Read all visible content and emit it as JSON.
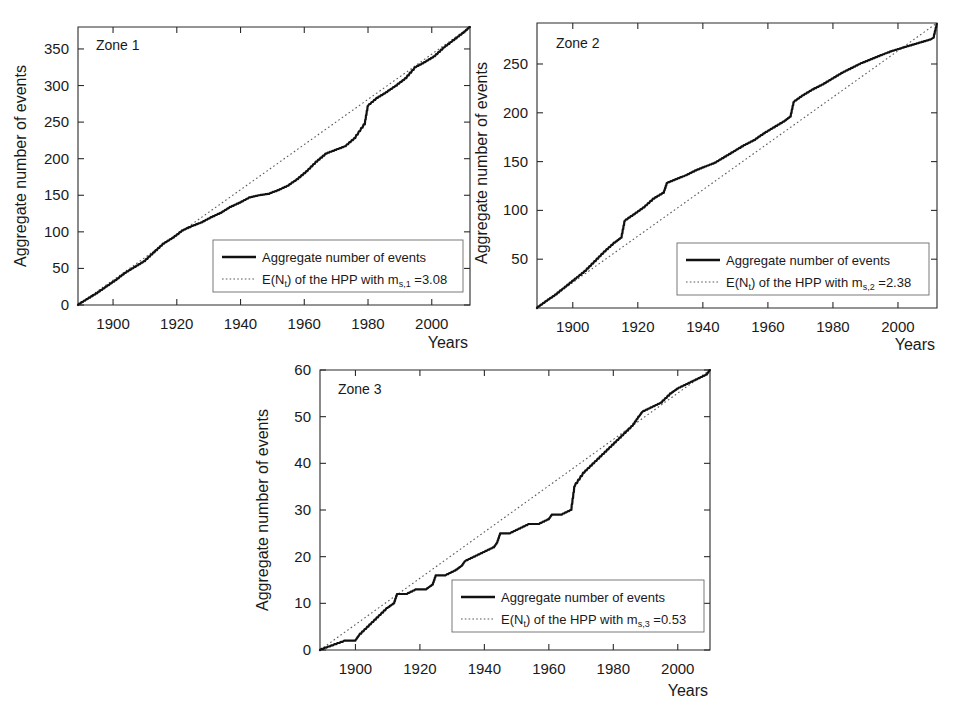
{
  "figure": {
    "background": "#ffffff",
    "line_color": "#111111",
    "hpp_color": "#5a5a5a"
  },
  "chart_data": [
    {
      "type": "line",
      "title": "Zone 1",
      "xlabel": "Years",
      "ylabel": "Aggregate number of events",
      "xlim": [
        1889,
        2012
      ],
      "ylim": [
        0,
        380
      ],
      "xticks": [
        1900,
        1920,
        1940,
        1960,
        1980,
        2000
      ],
      "yticks": [
        0,
        50,
        100,
        150,
        200,
        250,
        300,
        350
      ],
      "grid": false,
      "legend_position": "lower right",
      "legend": [
        "Aggregate number of events",
        "E(Nt) of the HPP with ms,1 =3.08"
      ],
      "rate": 3.08,
      "series": [
        {
          "name": "Aggregate number of events",
          "style": "solid",
          "x": [
            1889,
            1892,
            1895,
            1898,
            1901,
            1904,
            1907,
            1910,
            1913,
            1916,
            1919,
            1922,
            1925,
            1928,
            1931,
            1934,
            1937,
            1940,
            1943,
            1946,
            1949,
            1952,
            1955,
            1958,
            1961,
            1964,
            1967,
            1970,
            1973,
            1976,
            1979,
            1980,
            1983,
            1986,
            1989,
            1992,
            1995,
            1998,
            2001,
            2004,
            2007,
            2010,
            2012
          ],
          "values": [
            0,
            8,
            16,
            25,
            34,
            44,
            52,
            60,
            72,
            84,
            92,
            102,
            108,
            113,
            120,
            126,
            134,
            140,
            147,
            150,
            152,
            157,
            163,
            172,
            183,
            196,
            207,
            212,
            217,
            228,
            247,
            272,
            283,
            291,
            300,
            310,
            325,
            332,
            340,
            352,
            362,
            372,
            380
          ]
        },
        {
          "name": "E(Nt) of the HPP with ms,1 =3.08",
          "style": "dotted",
          "x": [
            1889,
            2012
          ],
          "values": [
            0,
            380
          ]
        }
      ]
    },
    {
      "type": "line",
      "title": "Zone 2",
      "xlabel": "Years",
      "ylabel": "Aggregate number of events",
      "xlim": [
        1889,
        2012
      ],
      "ylim": [
        0,
        292
      ],
      "xticks": [
        1900,
        1920,
        1940,
        1960,
        1980,
        2000
      ],
      "yticks": [
        50,
        100,
        150,
        200,
        250
      ],
      "grid": false,
      "legend_position": "lower right",
      "legend": [
        "Aggregate number of events",
        "E(Nt) of the HPP with ms,2 =2.38"
      ],
      "rate": 2.38,
      "series": [
        {
          "name": "Aggregate number of events",
          "style": "solid",
          "x": [
            1889,
            1892,
            1895,
            1898,
            1901,
            1904,
            1907,
            1910,
            1913,
            1915,
            1916,
            1919,
            1922,
            1925,
            1928,
            1929,
            1932,
            1935,
            1938,
            1941,
            1944,
            1947,
            1950,
            1953,
            1956,
            1959,
            1962,
            1965,
            1967,
            1968,
            1971,
            1974,
            1977,
            1980,
            1983,
            1986,
            1989,
            1992,
            1995,
            1998,
            2001,
            2004,
            2007,
            2010,
            2011,
            2012
          ],
          "values": [
            0,
            7,
            14,
            22,
            30,
            38,
            48,
            58,
            67,
            72,
            89,
            96,
            103,
            112,
            118,
            128,
            132,
            136,
            141,
            145,
            149,
            155,
            161,
            167,
            172,
            179,
            185,
            191,
            196,
            211,
            218,
            224,
            229,
            235,
            241,
            246,
            251,
            255,
            259,
            263,
            266,
            269,
            272,
            275,
            277,
            291
          ]
        },
        {
          "name": "E(Nt) of the HPP with ms,2 =2.38",
          "style": "dotted",
          "x": [
            1889,
            2012
          ],
          "values": [
            0,
            292
          ]
        }
      ]
    },
    {
      "type": "line",
      "title": "Zone 3",
      "xlabel": "Years",
      "ylabel": "Aggregate number of events",
      "xlim": [
        1889,
        2010
      ],
      "ylim": [
        0,
        60
      ],
      "xticks": [
        1900,
        1920,
        1940,
        1960,
        1980,
        2000
      ],
      "yticks": [
        0,
        10,
        20,
        30,
        40,
        50,
        60
      ],
      "grid": false,
      "legend_position": "lower right",
      "legend": [
        "Aggregate number of events",
        "E(Nt) of the HPP with ms,3 =0.53"
      ],
      "rate": 0.53,
      "series": [
        {
          "name": "Aggregate number of events",
          "style": "solid",
          "x": [
            1889,
            1893,
            1897,
            1900,
            1901,
            1904,
            1907,
            1910,
            1912,
            1913,
            1916,
            1919,
            1922,
            1924,
            1925,
            1928,
            1931,
            1933,
            1934,
            1937,
            1940,
            1943,
            1944,
            1945,
            1948,
            1951,
            1954,
            1957,
            1960,
            1961,
            1964,
            1967,
            1968,
            1971,
            1974,
            1977,
            1980,
            1983,
            1986,
            1988,
            1989,
            1992,
            1995,
            1998,
            2000,
            2003,
            2006,
            2009,
            2010
          ],
          "values": [
            0,
            1,
            2,
            2,
            3,
            5,
            7,
            9,
            10,
            12,
            12,
            13,
            13,
            14,
            16,
            16,
            17,
            18,
            19,
            20,
            21,
            22,
            23,
            25,
            25,
            26,
            27,
            27,
            28,
            29,
            29,
            30,
            35,
            38,
            40,
            42,
            44,
            46,
            48,
            50,
            51,
            52,
            53,
            55,
            56,
            57,
            58,
            59,
            60
          ]
        },
        {
          "name": "E(Nt) of the HPP with ms,3 =0.53",
          "style": "dotted",
          "x": [
            1889,
            2010
          ],
          "values": [
            0,
            60
          ]
        }
      ]
    }
  ],
  "panels": [
    {
      "zone_label": "Zone 1",
      "axis_x_label": "Years",
      "axis_y_label": "Aggregate number of events",
      "xticklabels": [
        "1900",
        "1920",
        "1940",
        "1960",
        "1980",
        "2000"
      ],
      "yticklabels": [
        "0",
        "50",
        "100",
        "150",
        "200",
        "250",
        "300",
        "350"
      ],
      "legend": {
        "series_label": "Aggregate number of events",
        "hpp_prefix": "E(N",
        "hpp_sub_t": "t",
        "hpp_mid": ") of the HPP with m",
        "hpp_sub_m": "s,1",
        "hpp_value": " =3.08"
      }
    },
    {
      "zone_label": "Zone 2",
      "axis_x_label": "Years",
      "axis_y_label": "Aggregate number of events",
      "xticklabels": [
        "1900",
        "1920",
        "1940",
        "1960",
        "1980",
        "2000"
      ],
      "yticklabels": [
        "50",
        "100",
        "150",
        "200",
        "250"
      ],
      "legend": {
        "series_label": "Aggregate number of events",
        "hpp_prefix": "E(N",
        "hpp_sub_t": "t",
        "hpp_mid": ") of the HPP with m",
        "hpp_sub_m": "s,2",
        "hpp_value": " =2.38"
      }
    },
    {
      "zone_label": "Zone 3",
      "axis_x_label": "Years",
      "axis_y_label": "Aggregate number of events",
      "xticklabels": [
        "1900",
        "1920",
        "1940",
        "1960",
        "1980",
        "2000"
      ],
      "yticklabels": [
        "0",
        "10",
        "20",
        "30",
        "40",
        "50",
        "60"
      ],
      "legend": {
        "series_label": "Aggregate number of events",
        "hpp_prefix": "E(N",
        "hpp_sub_t": "t",
        "hpp_mid": ") of the HPP with m",
        "hpp_sub_m": "s,3",
        "hpp_value": " =0.53"
      }
    }
  ]
}
